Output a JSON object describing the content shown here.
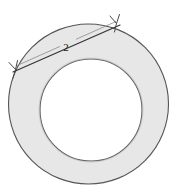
{
  "figure": {
    "type": "geometry-diagram",
    "title": "",
    "canvas": {
      "width": 177,
      "height": 195,
      "background": "#ffffff"
    },
    "shapes": {
      "outer_circle": {
        "name": "outer-circle",
        "cx": 88.5,
        "cy": 104.0,
        "r": 80.0,
        "fill": "#e7e7e7",
        "stroke": "#555555",
        "stroke_width": 1.1
      },
      "inner_circle": {
        "name": "inner-circle",
        "cx": 91.0,
        "cy": 110.0,
        "r": 51.0,
        "fill": "#ffffff",
        "stroke": "#555555",
        "stroke_width": 1.1
      },
      "chord": {
        "name": "tangent-chord",
        "x1": 13.0,
        "y1": 72.0,
        "x2": 120.0,
        "y2": 25.0,
        "stroke": "#333333",
        "stroke_width": 1.2
      },
      "dimension_line": {
        "name": "dimension-line",
        "x1": 16.0,
        "y1": 66.0,
        "x2": 116.0,
        "y2": 21.5,
        "stroke": "#8a8a8a",
        "stroke_width": 0.8,
        "gap_start": 0.44,
        "gap_end": 0.6
      }
    },
    "arrowheads": [
      {
        "name": "arrowhead-left",
        "x": 14.0,
        "y": 68.0,
        "angle_deg": 204
      },
      {
        "name": "arrowhead-right",
        "x": 117.0,
        "y": 22.0,
        "angle_deg": 24
      }
    ],
    "labels": {
      "chord_length": {
        "name": "chord-length-label",
        "text": "2",
        "x": 66.0,
        "y": 51.0
      }
    },
    "colors": {
      "ring_fill": "#e7e7e7",
      "hole_fill": "#ffffff",
      "outline": "#555555",
      "chord_stroke": "#333333",
      "dimension_stroke": "#8a8a8a",
      "label_color": "#1a1a1a",
      "background": "#ffffff"
    }
  }
}
